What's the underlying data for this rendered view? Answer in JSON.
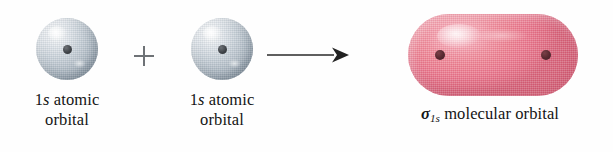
{
  "diagram": {
    "type": "chemistry-orbital-combination",
    "background_color": "#fefefe",
    "reactant_label_prefix": "1",
    "reactant_label_italic": "s",
    "reactant_label_rest": " atomic",
    "reactant_label_line2": "orbital",
    "operator": "+",
    "arrow": "right-arrow",
    "reactants": [
      {
        "name": "1s atomic orbital",
        "label_line1_prefix": "1",
        "label_line1_italic": "s",
        "label_line1_suffix": " atomic",
        "label_line2": "orbital",
        "shape": "sphere",
        "color": "#a9b4be",
        "highlight_color": "#ffffff",
        "nucleus_color": "#2b2f33",
        "nucleus_count": 1
      },
      {
        "name": "1s atomic orbital",
        "label_line1_prefix": "1",
        "label_line1_italic": "s",
        "label_line1_suffix": " atomic",
        "label_line2": "orbital",
        "shape": "sphere",
        "color": "#a9b4be",
        "highlight_color": "#ffffff",
        "nucleus_color": "#2b2f33",
        "nucleus_count": 1
      }
    ],
    "product": {
      "name": "sigma 1s molecular orbital",
      "label_sigma": "σ",
      "label_subscript": "1s",
      "label_rest": " molecular orbital",
      "shape": "capsule",
      "color": "#e8748a",
      "highlight_color": "#fbd2d8",
      "edge_color": "#d55f76",
      "nucleus_color": "#56282f",
      "nucleus_count": 2
    },
    "arrow_color": "#2a2a2a",
    "plus_color": "#6e7276",
    "text_color": "#141414"
  }
}
